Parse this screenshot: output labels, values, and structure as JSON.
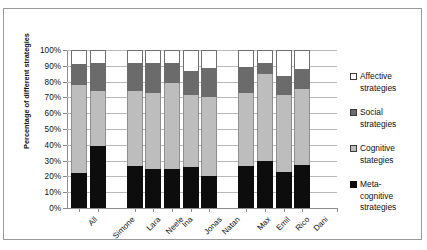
{
  "chart_data": {
    "type": "bar",
    "subtype": "stacked-column-100",
    "title": "",
    "xlabel": "",
    "ylabel": "Percentage of different strategies",
    "ylim": [
      0,
      100
    ],
    "ytick_labels": [
      "0%",
      "10%",
      "20%",
      "30%",
      "40%",
      "50%",
      "60%",
      "70%",
      "80%",
      "90%",
      "100%"
    ],
    "ytick_values": [
      0,
      10,
      20,
      30,
      40,
      50,
      60,
      70,
      80,
      90,
      100
    ],
    "grid": true,
    "legend_position": "right",
    "categories": [
      "All",
      "Simone",
      "Lara",
      "Neele",
      "Ina",
      "Jonas",
      "Natan",
      "Max",
      "Emil",
      "Rico",
      "Dani"
    ],
    "group_gaps_after": [
      "Simone",
      "Natan"
    ],
    "series": [
      {
        "name": "Meta-cognitive strategies",
        "color": "#0d0d0d",
        "values": [
          22,
          39,
          26.5,
          24.5,
          25,
          26,
          20.5,
          26.5,
          29.5,
          22.5,
          27.5
        ]
      },
      {
        "name": "Cognitive stategies",
        "color": "#bdbdbd",
        "values": [
          56,
          35,
          47.5,
          48,
          54,
          45.5,
          50,
          46.5,
          55.5,
          49,
          48
        ]
      },
      {
        "name": "Social strategies",
        "color": "#6b6b6b",
        "values": [
          13,
          17.5,
          17.5,
          19,
          13,
          15.5,
          18,
          16.5,
          6.5,
          12,
          12.5
        ]
      },
      {
        "name": "Affective strategies",
        "color": "#ffffff",
        "values": [
          9,
          8.5,
          8.5,
          8.5,
          8,
          13,
          11.5,
          10.5,
          8.5,
          16.5,
          12
        ]
      }
    ],
    "cumulative_tops": {
      "meta": [
        22,
        39,
        26.5,
        24.5,
        25,
        26,
        20.5,
        26.5,
        29.5,
        22.5,
        27.5
      ],
      "cognitive": [
        78,
        74,
        74,
        72.5,
        79,
        71.5,
        70.5,
        73,
        85,
        71.5,
        75.5
      ],
      "social": [
        91,
        91.5,
        91.5,
        91.5,
        92,
        87,
        88.5,
        89.5,
        91.5,
        83.5,
        88
      ],
      "affective": [
        100,
        100,
        100,
        100,
        100,
        100,
        100,
        100,
        100,
        100,
        100
      ]
    }
  },
  "legend": {
    "items": [
      {
        "label_line1": "Affective",
        "label_line2": "strategies",
        "swatch": "affective-swatch"
      },
      {
        "label_line1": "Social",
        "label_line2": "strategies",
        "swatch": "social-swatch"
      },
      {
        "label_line1": "Cognitive",
        "label_line2": "stategies",
        "swatch": "cognitive-swatch"
      },
      {
        "label_line1": "Meta-",
        "label_line2": "cognitive",
        "label_line3": "strategies",
        "swatch": "meta-cognitive-swatch"
      }
    ]
  }
}
